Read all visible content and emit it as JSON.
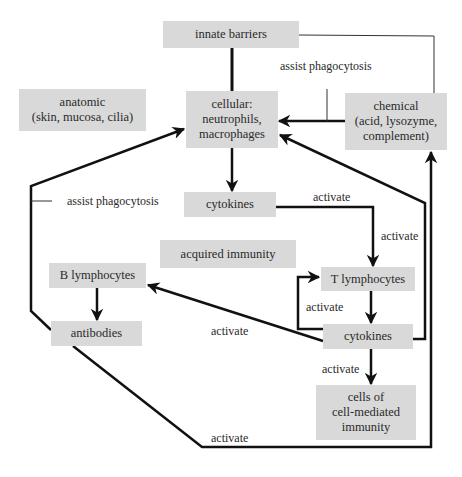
{
  "diagram": {
    "nodes": {
      "innate_barriers": "innate barriers",
      "anatomic": "anatomic\n(skin, mucosa, cilia)",
      "cellular": "cellular:\nneutrophils,\nmacrophages",
      "chemical": "chemical\n(acid, lysozyme,\ncomplement)",
      "cytokines_innate": "cytokines",
      "acquired_immunity": "acquired immunity",
      "b_lymphocytes": "B lymphocytes",
      "t_lymphocytes": "T lymphocytes",
      "antibodies": "antibodies",
      "cytokines_acquired": "cytokines",
      "cell_mediated": "cells of\ncell-mediated\nimmunity"
    },
    "edge_labels": {
      "assist_phagocytosis_top": "assist phagocytosis",
      "assist_phagocytosis_left": "assist phagocytosis",
      "activate_cytokines_right": "activate",
      "activate_to_t": "activate",
      "activate_loop": "activate",
      "activate_to_b": "activate",
      "activate_to_cells": "activate",
      "activate_antibodies_chemical": "activate"
    },
    "edges": [
      {
        "from": "innate barriers",
        "to": "cellular",
        "type": "line"
      },
      {
        "from": "innate barriers",
        "to": "chemical",
        "type": "thin-line"
      },
      {
        "from": "chemical",
        "to": "cellular",
        "label": "assist phagocytosis",
        "type": "arrow"
      },
      {
        "from": "cellular",
        "to": "cytokines",
        "type": "arrow"
      },
      {
        "from": "cytokines",
        "to": "T lymphocytes",
        "label": "activate",
        "type": "arrow"
      },
      {
        "from": "T lymphocytes",
        "to": "cytokines",
        "type": "arrow"
      },
      {
        "from": "cytokines",
        "to": "T lymphocytes",
        "label": "activate",
        "type": "loop-arrow"
      },
      {
        "from": "cytokines",
        "to": "B lymphocytes",
        "label": "activate",
        "type": "arrow"
      },
      {
        "from": "cytokines",
        "to": "cellular",
        "type": "arrow"
      },
      {
        "from": "cytokines",
        "to": "cells of cell-mediated immunity",
        "label": "activate",
        "type": "arrow"
      },
      {
        "from": "B lymphocytes",
        "to": "antibodies",
        "type": "arrow"
      },
      {
        "from": "antibodies",
        "to": "cellular",
        "label": "assist phagocytosis",
        "type": "arrow"
      },
      {
        "from": "antibodies",
        "to": "chemical",
        "label": "activate",
        "type": "arrow"
      }
    ]
  }
}
